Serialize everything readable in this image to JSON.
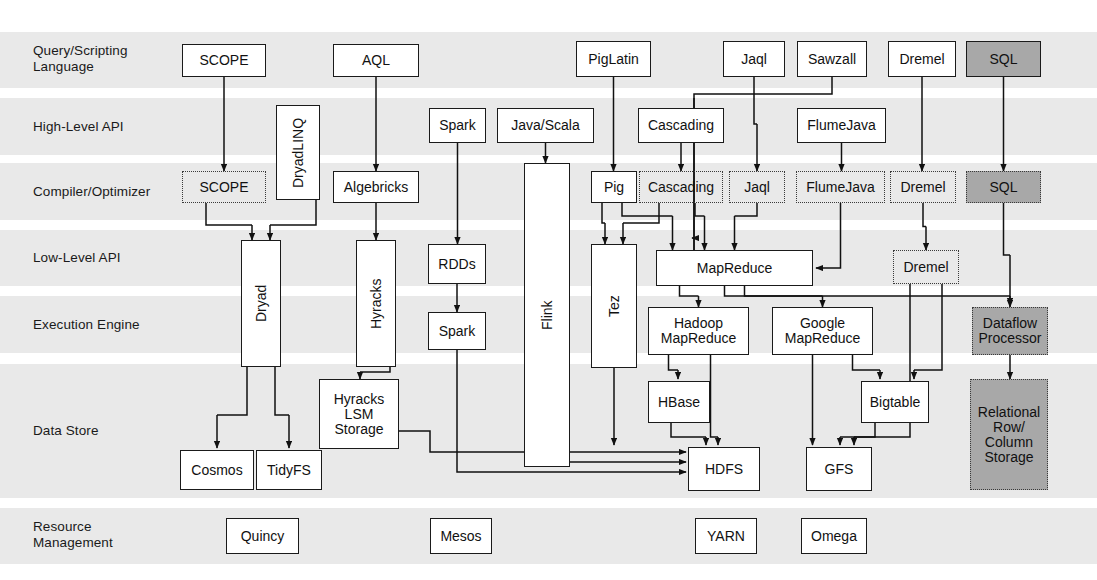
{
  "diagram": {
    "background": "#ffffff",
    "band_color": "#e9e9e9",
    "gray_fill": "#a8a8a8",
    "line_color": "#111111"
  },
  "rows": [
    {
      "id": "query",
      "label": "Query/Scripting\nLanguage",
      "y": 32,
      "h": 56
    },
    {
      "id": "highapi",
      "label": "High-Level API",
      "y": 98,
      "h": 57
    },
    {
      "id": "compiler",
      "label": "Compiler/Optimizer",
      "y": 163,
      "h": 57
    },
    {
      "id": "lowapi",
      "label": "Low-Level API",
      "y": 230,
      "h": 56
    },
    {
      "id": "execution",
      "label": "Execution Engine",
      "y": 296,
      "h": 57
    },
    {
      "id": "datastore",
      "label": "Data Store",
      "y": 364,
      "h": 134
    },
    {
      "id": "resource",
      "label": "Resource\nManagement",
      "y": 508,
      "h": 56
    }
  ],
  "nodes": [
    {
      "id": "scope-lang",
      "label": "SCOPE",
      "x": 182,
      "y": 44,
      "w": 84,
      "h": 33,
      "style": "solid",
      "row": "query"
    },
    {
      "id": "aql",
      "label": "AQL",
      "x": 333,
      "y": 44,
      "w": 86,
      "h": 33,
      "style": "solid",
      "row": "query"
    },
    {
      "id": "piglatin",
      "label": "PigLatin",
      "x": 576,
      "y": 41,
      "w": 75,
      "h": 36,
      "style": "solid",
      "row": "query"
    },
    {
      "id": "jaql-lang",
      "label": "Jaql",
      "x": 723,
      "y": 41,
      "w": 62,
      "h": 36,
      "style": "solid",
      "row": "query"
    },
    {
      "id": "sawzall",
      "label": "Sawzall",
      "x": 797,
      "y": 41,
      "w": 70,
      "h": 36,
      "style": "solid",
      "row": "query"
    },
    {
      "id": "dremel-lang",
      "label": "Dremel",
      "x": 888,
      "y": 41,
      "w": 68,
      "h": 36,
      "style": "solid",
      "row": "query"
    },
    {
      "id": "sql-lang",
      "label": "SQL",
      "x": 966,
      "y": 41,
      "w": 75,
      "h": 36,
      "style": "gray",
      "row": "query"
    },
    {
      "id": "dryadlinq",
      "label": "DryadLINQ",
      "x": 276,
      "y": 105,
      "w": 44,
      "h": 95,
      "style": "solid",
      "row": "highapi",
      "vertical": true
    },
    {
      "id": "spark-api",
      "label": "Spark",
      "x": 429,
      "y": 108,
      "w": 57,
      "h": 35,
      "style": "solid",
      "row": "highapi"
    },
    {
      "id": "javascala",
      "label": "Java/Scala",
      "x": 497,
      "y": 108,
      "w": 97,
      "h": 35,
      "style": "solid",
      "row": "highapi"
    },
    {
      "id": "cascading-api",
      "label": "Cascading",
      "x": 638,
      "y": 108,
      "w": 86,
      "h": 35,
      "style": "solid",
      "row": "highapi"
    },
    {
      "id": "flumejava-api",
      "label": "FlumeJava",
      "x": 797,
      "y": 108,
      "w": 89,
      "h": 35,
      "style": "solid",
      "row": "highapi"
    },
    {
      "id": "scope-comp",
      "label": "SCOPE",
      "x": 182,
      "y": 171,
      "w": 84,
      "h": 32,
      "style": "dashed",
      "row": "compiler"
    },
    {
      "id": "algebricks",
      "label": "Algebricks",
      "x": 333,
      "y": 171,
      "w": 86,
      "h": 32,
      "style": "solid",
      "row": "compiler"
    },
    {
      "id": "pig-comp",
      "label": "Pig",
      "x": 591,
      "y": 171,
      "w": 46,
      "h": 32,
      "style": "solid",
      "row": "compiler"
    },
    {
      "id": "cascading-comp",
      "label": "Cascading",
      "x": 639,
      "y": 171,
      "w": 84,
      "h": 32,
      "style": "dashed",
      "row": "compiler"
    },
    {
      "id": "jaql-comp",
      "label": "Jaql",
      "x": 729,
      "y": 171,
      "w": 56,
      "h": 32,
      "style": "dashed",
      "row": "compiler"
    },
    {
      "id": "flumejava-comp",
      "label": "FlumeJava",
      "x": 796,
      "y": 171,
      "w": 89,
      "h": 32,
      "style": "dashed",
      "row": "compiler"
    },
    {
      "id": "dremel-comp",
      "label": "Dremel",
      "x": 890,
      "y": 171,
      "w": 66,
      "h": 32,
      "style": "dashed",
      "row": "compiler"
    },
    {
      "id": "sql-comp",
      "label": "SQL",
      "x": 966,
      "y": 171,
      "w": 75,
      "h": 32,
      "style": "graydash",
      "row": "compiler"
    },
    {
      "id": "dryad",
      "label": "Dryad",
      "x": 241,
      "y": 240,
      "w": 40,
      "h": 127,
      "style": "solid",
      "row": "lowapi",
      "vertical": true
    },
    {
      "id": "hyracks",
      "label": "Hyracks",
      "x": 356,
      "y": 240,
      "w": 40,
      "h": 127,
      "style": "solid",
      "row": "lowapi",
      "vertical": true
    },
    {
      "id": "rdds",
      "label": "RDDs",
      "x": 428,
      "y": 244,
      "w": 58,
      "h": 40,
      "style": "solid",
      "row": "lowapi"
    },
    {
      "id": "flink",
      "label": "Flink",
      "x": 524,
      "y": 163,
      "w": 46,
      "h": 304,
      "style": "solid",
      "row": "lowapi",
      "vertical": true
    },
    {
      "id": "tez",
      "label": "Tez",
      "x": 591,
      "y": 244,
      "w": 46,
      "h": 124,
      "style": "solid",
      "row": "lowapi",
      "vertical": true
    },
    {
      "id": "mapreduce",
      "label": "MapReduce",
      "x": 656,
      "y": 250,
      "w": 157,
      "h": 36,
      "style": "solid",
      "row": "lowapi"
    },
    {
      "id": "dremel-low",
      "label": "Dremel",
      "x": 893,
      "y": 250,
      "w": 66,
      "h": 34,
      "style": "dashed",
      "row": "lowapi"
    },
    {
      "id": "spark-exec",
      "label": "Spark",
      "x": 428,
      "y": 312,
      "w": 58,
      "h": 38,
      "style": "solid",
      "row": "execution"
    },
    {
      "id": "hadoop-mr",
      "label": "Hadoop\nMapReduce",
      "x": 648,
      "y": 307,
      "w": 101,
      "h": 48,
      "style": "solid",
      "row": "execution"
    },
    {
      "id": "google-mr",
      "label": "Google\nMapReduce",
      "x": 772,
      "y": 307,
      "w": 101,
      "h": 48,
      "style": "solid",
      "row": "execution"
    },
    {
      "id": "dataflow-proc",
      "label": "Dataflow\nProcessor",
      "x": 972,
      "y": 307,
      "w": 76,
      "h": 48,
      "style": "graydash",
      "row": "execution"
    },
    {
      "id": "hyracks-lsm",
      "label": "Hyracks\nLSM\nStorage",
      "x": 319,
      "y": 379,
      "w": 80,
      "h": 70,
      "style": "solid",
      "row": "datastore"
    },
    {
      "id": "hbase",
      "label": "HBase",
      "x": 648,
      "y": 381,
      "w": 62,
      "h": 42,
      "style": "solid",
      "row": "datastore"
    },
    {
      "id": "bigtable",
      "label": "Bigtable",
      "x": 861,
      "y": 381,
      "w": 68,
      "h": 42,
      "style": "solid",
      "row": "datastore"
    },
    {
      "id": "cosmos",
      "label": "Cosmos",
      "x": 180,
      "y": 450,
      "w": 74,
      "h": 40,
      "style": "solid",
      "row": "datastore"
    },
    {
      "id": "tidyfs",
      "label": "TidyFS",
      "x": 256,
      "y": 450,
      "w": 66,
      "h": 40,
      "style": "solid",
      "row": "datastore"
    },
    {
      "id": "hdfs",
      "label": "HDFS",
      "x": 688,
      "y": 447,
      "w": 72,
      "h": 44,
      "style": "solid",
      "row": "datastore"
    },
    {
      "id": "gfs",
      "label": "GFS",
      "x": 806,
      "y": 447,
      "w": 66,
      "h": 44,
      "style": "solid",
      "row": "datastore"
    },
    {
      "id": "relational",
      "label": "Relational\nRow/\nColumn\nStorage",
      "x": 970,
      "y": 379,
      "w": 78,
      "h": 111,
      "style": "graydash",
      "row": "datastore"
    },
    {
      "id": "quincy",
      "label": "Quincy",
      "x": 226,
      "y": 518,
      "w": 73,
      "h": 36,
      "style": "solid",
      "row": "resource"
    },
    {
      "id": "mesos",
      "label": "Mesos",
      "x": 430,
      "y": 518,
      "w": 62,
      "h": 36,
      "style": "solid",
      "row": "resource"
    },
    {
      "id": "yarn",
      "label": "YARN",
      "x": 695,
      "y": 518,
      "w": 62,
      "h": 36,
      "style": "solid",
      "row": "resource"
    },
    {
      "id": "omega",
      "label": "Omega",
      "x": 801,
      "y": 518,
      "w": 66,
      "h": 36,
      "style": "solid",
      "row": "resource"
    }
  ],
  "edges": [
    {
      "from": "scope-lang",
      "to": "scope-comp"
    },
    {
      "from": "aql",
      "to": "algebricks"
    },
    {
      "from": "piglatin",
      "to": "pig-comp"
    },
    {
      "from": "jaql-lang",
      "to": "jaql-comp"
    },
    {
      "from": "sawzall",
      "to": "mapreduce"
    },
    {
      "from": "dremel-lang",
      "to": "dremel-comp"
    },
    {
      "from": "sql-lang",
      "to": "sql-comp"
    },
    {
      "from": "spark-api",
      "to": "rdds"
    },
    {
      "from": "javascala",
      "to": "flink"
    },
    {
      "from": "cascading-api",
      "to": "cascading-comp"
    },
    {
      "from": "flumejava-api",
      "to": "flumejava-comp"
    },
    {
      "from": "scope-comp",
      "to": "dryad"
    },
    {
      "from": "dryadlinq",
      "to": "dryad"
    },
    {
      "from": "algebricks",
      "to": "hyracks"
    },
    {
      "from": "pig-comp",
      "to": "tez"
    },
    {
      "from": "pig-comp",
      "to": "mapreduce"
    },
    {
      "from": "cascading-comp",
      "to": "tez"
    },
    {
      "from": "cascading-comp",
      "to": "mapreduce"
    },
    {
      "from": "jaql-comp",
      "to": "mapreduce"
    },
    {
      "from": "flumejava-comp",
      "to": "mapreduce"
    },
    {
      "from": "dremel-comp",
      "to": "dremel-low"
    },
    {
      "from": "sql-comp",
      "to": "dataflow-proc"
    },
    {
      "from": "rdds",
      "to": "spark-exec"
    },
    {
      "from": "mapreduce",
      "to": "hadoop-mr"
    },
    {
      "from": "mapreduce",
      "to": "google-mr"
    },
    {
      "from": "mapreduce",
      "to": "dataflow-proc"
    },
    {
      "from": "hyracks",
      "to": "hyracks-lsm"
    },
    {
      "from": "dryad",
      "to": "cosmos"
    },
    {
      "from": "dryad",
      "to": "tidyfs"
    },
    {
      "from": "hadoop-mr",
      "to": "hbase"
    },
    {
      "from": "hadoop-mr",
      "to": "hdfs"
    },
    {
      "from": "hbase",
      "to": "hdfs"
    },
    {
      "from": "tez",
      "to": "hdfs"
    },
    {
      "from": "google-mr",
      "to": "bigtable"
    },
    {
      "from": "google-mr",
      "to": "gfs"
    },
    {
      "from": "bigtable",
      "to": "gfs"
    },
    {
      "from": "dremel-low",
      "to": "gfs"
    },
    {
      "from": "dremel-low",
      "to": "bigtable"
    },
    {
      "from": "hyracks-lsm",
      "to": "hdfs"
    },
    {
      "from": "flink",
      "to": "hdfs"
    },
    {
      "from": "spark-exec",
      "to": "hdfs"
    },
    {
      "from": "dataflow-proc",
      "to": "relational"
    }
  ]
}
